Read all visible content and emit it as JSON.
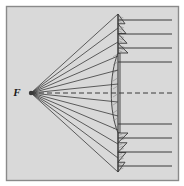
{
  "figure": {
    "title": "Fresnel lens collimating rays from a point source",
    "type": "optics-ray-diagram",
    "width": 184,
    "height": 186,
    "background_color": "#d9d9d9",
    "frame_color": "#8a8a8a",
    "outer_color": "#ffffff",
    "ink_color": "#3a3a3a",
    "lens_fill": "#cfcfcf"
  },
  "labels": {
    "focal_point": "F"
  },
  "geometry": {
    "frame": {
      "x": 6,
      "y": 6,
      "width": 172,
      "height": 174
    },
    "focal_point": {
      "x": 31,
      "y": 93
    },
    "focal_label": {
      "x": 17,
      "y": 96
    },
    "axis": {
      "y": 93,
      "x_start": 31,
      "x_end": 172
    },
    "lens": {
      "x_axis": 118,
      "top_y": 14,
      "bottom_y": 172,
      "center_half_height": 40,
      "center_bulge": 9,
      "prism_count_per_side": 4
    },
    "ray_right_end": 172
  },
  "chart_data": {
    "type": "scatter",
    "xlabel": "",
    "ylabel": "",
    "ray_heights_incoming": [
      14,
      28,
      42,
      56,
      70,
      84,
      93,
      102,
      116,
      130,
      144,
      158,
      172
    ],
    "ray_heights_outgoing": [
      20,
      34,
      48,
      62,
      93,
      124,
      138,
      152,
      166
    ],
    "annotations": [
      "F"
    ]
  }
}
